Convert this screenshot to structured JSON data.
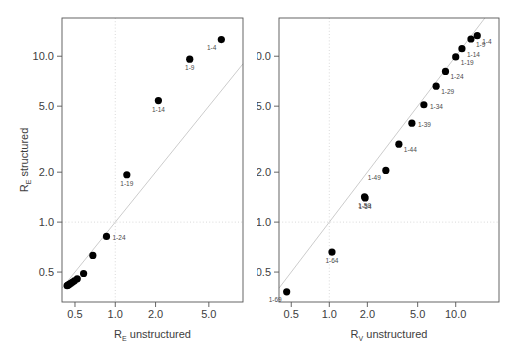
{
  "figure": {
    "background": "#ffffff",
    "point_color": "#000000",
    "frame_color": "#555555",
    "grid_color": "#cfcfcf",
    "refline_color": "#cccccc",
    "text_color": "#3d3d3d"
  },
  "chart_data": [
    {
      "type": "scatter",
      "panel": "left",
      "title": "",
      "xlabel": "R",
      "xlabel_sub": "E",
      "xlabel_rest": " unstructured",
      "ylabel": "R",
      "ylabel_sub": "E",
      "ylabel_rest": " structured",
      "xscale": "log",
      "yscale": "log",
      "xticks": [
        0.5,
        1.0,
        2.0,
        5.0
      ],
      "xticklabels": [
        "0.5",
        "1.0",
        "2.0",
        "5.0"
      ],
      "yticks": [
        0.5,
        1.0,
        2.0,
        5.0,
        10.0
      ],
      "yticklabels": [
        "0.5",
        "1.0",
        "2.0",
        "5.0",
        "10.0"
      ],
      "xlim": [
        0.4,
        9.0
      ],
      "ylim": [
        0.33,
        17.0
      ],
      "grid": true,
      "gridlines_x": [
        1.0
      ],
      "gridlines_y": [
        1.0
      ],
      "reference_line": {
        "type": "identity",
        "label": "y = x"
      },
      "legend": "none",
      "points": [
        {
          "label": "1-4",
          "x": 6.2,
          "y": 12.6,
          "labeled": true,
          "label_pos": "below-left"
        },
        {
          "label": "1-9",
          "x": 3.6,
          "y": 9.6,
          "labeled": true,
          "label_pos": "below"
        },
        {
          "label": "1-14",
          "x": 2.1,
          "y": 5.4,
          "labeled": true,
          "label_pos": "below"
        },
        {
          "label": "1-19",
          "x": 1.22,
          "y": 1.93,
          "labeled": true,
          "label_pos": "below"
        },
        {
          "label": "1-24",
          "x": 0.86,
          "y": 0.82,
          "labeled": true,
          "label_pos": "right"
        },
        {
          "label": "1-29",
          "x": 0.68,
          "y": 0.63,
          "labeled": false,
          "label_pos": "below"
        },
        {
          "label": "1-34",
          "x": 0.58,
          "y": 0.49,
          "labeled": false,
          "label_pos": "below"
        },
        {
          "label": "1-39",
          "x": 0.52,
          "y": 0.455,
          "labeled": false,
          "label_pos": "below"
        },
        {
          "label": "1-44",
          "x": 0.495,
          "y": 0.443,
          "labeled": false,
          "label_pos": "below"
        },
        {
          "label": "1-49",
          "x": 0.478,
          "y": 0.434,
          "labeled": false,
          "label_pos": "below"
        },
        {
          "label": "1-54",
          "x": 0.464,
          "y": 0.427,
          "labeled": false,
          "label_pos": "below"
        },
        {
          "label": "1-59",
          "x": 0.452,
          "y": 0.421,
          "labeled": false,
          "label_pos": "below"
        },
        {
          "label": "1-64",
          "x": 0.444,
          "y": 0.417,
          "labeled": false,
          "label_pos": "below"
        },
        {
          "label": "1-69",
          "x": 0.437,
          "y": 0.414,
          "labeled": false,
          "label_pos": "below"
        }
      ]
    },
    {
      "type": "scatter",
      "panel": "right",
      "title": "",
      "xlabel": "R",
      "xlabel_sub": "V",
      "xlabel_rest": " unstructured",
      "ylabel": "",
      "ylabel_sub": "",
      "ylabel_rest": "",
      "xscale": "log",
      "yscale": "log",
      "xticks": [
        0.5,
        1.0,
        2.0,
        5.0,
        10.0
      ],
      "xticklabels": [
        "0.5",
        "1.0",
        "2.0",
        "5.0",
        "10.0"
      ],
      "yticks": [
        0.5,
        1.0,
        2.0,
        5.0,
        10.0
      ],
      "yticklabels": [
        "0.5",
        "1.0",
        "2.0",
        "5.0",
        "10.0"
      ],
      "xlim": [
        0.4,
        22.0
      ],
      "ylim": [
        0.33,
        17.0
      ],
      "grid": true,
      "gridlines_x": [
        1.0
      ],
      "gridlines_y": [
        1.0
      ],
      "reference_line": {
        "type": "identity",
        "label": "y = x"
      },
      "legend": "none",
      "points": [
        {
          "label": "1-4",
          "x": 14.8,
          "y": 13.3,
          "labeled": true,
          "label_pos": "below-right"
        },
        {
          "label": "1-9",
          "x": 13.2,
          "y": 12.7,
          "labeled": true,
          "label_pos": "below-right"
        },
        {
          "label": "1-14",
          "x": 11.2,
          "y": 11.1,
          "labeled": true,
          "label_pos": "below-right"
        },
        {
          "label": "1-19",
          "x": 10.0,
          "y": 9.9,
          "labeled": true,
          "label_pos": "below-right"
        },
        {
          "label": "1-24",
          "x": 8.3,
          "y": 8.1,
          "labeled": true,
          "label_pos": "below-right"
        },
        {
          "label": "1-29",
          "x": 7.0,
          "y": 6.6,
          "labeled": true,
          "label_pos": "below-right"
        },
        {
          "label": "1-34",
          "x": 5.6,
          "y": 5.1,
          "labeled": true,
          "label_pos": "right"
        },
        {
          "label": "1-39",
          "x": 4.5,
          "y": 3.95,
          "labeled": true,
          "label_pos": "right"
        },
        {
          "label": "1-44",
          "x": 3.55,
          "y": 2.95,
          "labeled": true,
          "label_pos": "below-right"
        },
        {
          "label": "1-49",
          "x": 2.8,
          "y": 2.05,
          "labeled": true,
          "label_pos": "below-left"
        },
        {
          "label": "1-54",
          "x": 1.92,
          "y": 1.4,
          "labeled": true,
          "label_pos": "below"
        },
        {
          "label": "1-59",
          "x": 1.9,
          "y": 1.42,
          "labeled": true,
          "label_pos": "below"
        },
        {
          "label": "1-64",
          "x": 1.05,
          "y": 0.66,
          "labeled": true,
          "label_pos": "below"
        },
        {
          "label": "1-69",
          "x": 0.46,
          "y": 0.38,
          "labeled": true,
          "label_pos": "below-left"
        }
      ]
    }
  ]
}
